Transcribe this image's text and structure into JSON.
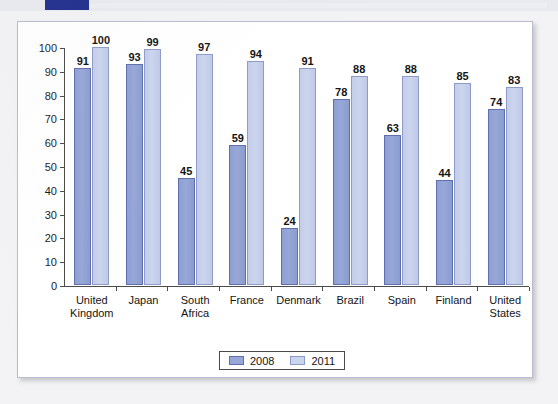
{
  "banner": {
    "accent_color": "#1f2e8c"
  },
  "chart_data": {
    "type": "bar",
    "title": "",
    "subtitle": "",
    "xlabel": "",
    "ylabel": "",
    "ylim": [
      0,
      100
    ],
    "ytick_step": 10,
    "yticks": [
      "0",
      "10",
      "20",
      "30",
      "40",
      "50",
      "60",
      "70",
      "80",
      "90",
      "100"
    ],
    "grid": false,
    "legend_position": "bottom-center",
    "categories": [
      "United Kingdom",
      "Japan",
      "South Africa",
      "France",
      "Denmark",
      "Brazil",
      "Spain",
      "Finland",
      "United States"
    ],
    "category_lines": [
      [
        "United",
        "Kingdom"
      ],
      [
        "Japan"
      ],
      [
        "South",
        "Africa"
      ],
      [
        "France"
      ],
      [
        "Denmark"
      ],
      [
        "Brazil"
      ],
      [
        "Spain"
      ],
      [
        "Finland"
      ],
      [
        "United",
        "States"
      ]
    ],
    "series": [
      {
        "name": "2008",
        "color": "#97a7d7",
        "border_color": "#5f6fae",
        "values": [
          91,
          93,
          45,
          59,
          24,
          78,
          63,
          44,
          74
        ]
      },
      {
        "name": "2011",
        "color": "#ccd5ee",
        "border_color": "#8e9bc9",
        "values": [
          100,
          99,
          97,
          94,
          91,
          88,
          88,
          85,
          83
        ]
      }
    ]
  },
  "legend": {
    "items": [
      {
        "label": "2008"
      },
      {
        "label": "2011"
      }
    ]
  }
}
